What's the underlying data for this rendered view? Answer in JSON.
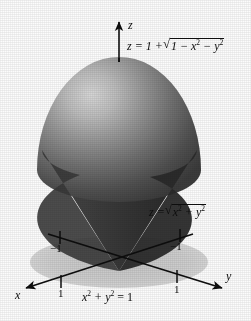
{
  "figure": {
    "background_color": "#fcfcfc",
    "ink_color": "#0d0d0d",
    "shadow_disk_color": "#cfcfcf",
    "sphere_highlight_color": "#cfcfcf",
    "sphere_mid_color": "#8a8a8a",
    "sphere_dark_color": "#4a4a4a",
    "cone_color": "#3a3a3a",
    "cone_dark_color": "#262626"
  },
  "axes": {
    "z": {
      "name": "z",
      "direction": "up"
    },
    "x": {
      "name": "x",
      "direction": "down-left"
    },
    "y": {
      "name": "y",
      "direction": "down-right"
    }
  },
  "ticks": [
    {
      "label": "−1",
      "axis": "x",
      "position": "upper-left"
    },
    {
      "label": "−1",
      "axis": "y",
      "position": "upper-right"
    },
    {
      "label": "1",
      "axis": "x",
      "position": "lower-left"
    },
    {
      "label": "1",
      "axis": "y",
      "position": "lower-right"
    }
  ],
  "labels": {
    "sphere": {
      "lhs": "z = 1 +",
      "radicand_a": "1 − x",
      "radicand_exp_a": "2",
      "radicand_b": " − y",
      "radicand_exp_b": "2",
      "plain": "z = 1 + √(1 − x² − y²)"
    },
    "cone": {
      "lhs": "z =",
      "radicand_a": "x",
      "radicand_exp_a": "2",
      "radicand_b": " + y",
      "radicand_exp_b": "2",
      "plain": "z = √(x² + y²)"
    },
    "circle": {
      "a": "x",
      "exp_a": "2",
      "b": " + y",
      "exp_b": "2",
      "c": " = 1",
      "plain": "x² + y² = 1"
    }
  }
}
